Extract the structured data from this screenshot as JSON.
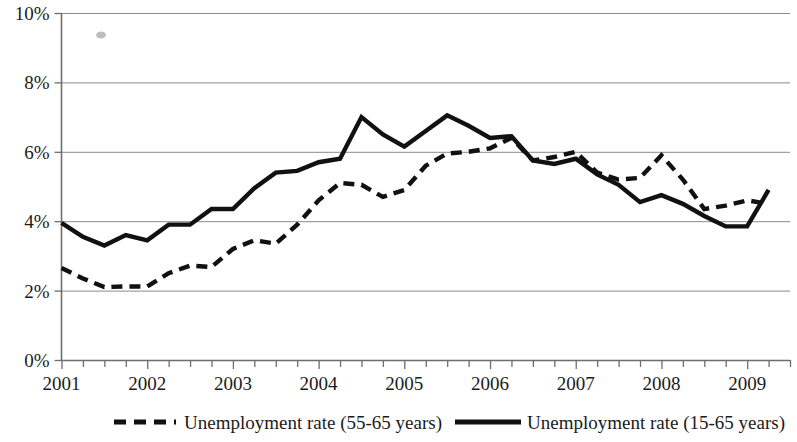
{
  "chart_data": {
    "type": "line",
    "title": "",
    "subtitle": "",
    "xlabel": "",
    "ylabel": "",
    "grid": true,
    "legend_position": "bottom",
    "ylim": [
      0,
      10
    ],
    "y_ticks": [
      "0%",
      "2%",
      "4%",
      "6%",
      "8%",
      "10%"
    ],
    "y_tick_values": [
      0,
      2,
      4,
      6,
      8,
      10
    ],
    "x_ticks": [
      "2001",
      "2002",
      "2003",
      "2004",
      "2005",
      "2006",
      "2007",
      "2008",
      "2009"
    ],
    "x_tick_values": [
      2001,
      2002,
      2003,
      2004,
      2005,
      2006,
      2007,
      2008,
      2009
    ],
    "x_minor_interval_label": "quarterly",
    "xlim": [
      2001,
      2009.5
    ],
    "x": [
      2001.0,
      2001.25,
      2001.5,
      2001.75,
      2002.0,
      2002.25,
      2002.5,
      2002.75,
      2003.0,
      2003.25,
      2003.5,
      2003.75,
      2004.0,
      2004.25,
      2004.5,
      2004.75,
      2005.0,
      2005.25,
      2005.5,
      2005.75,
      2006.0,
      2006.25,
      2006.5,
      2006.75,
      2007.0,
      2007.25,
      2007.5,
      2007.75,
      2008.0,
      2008.25,
      2008.5,
      2008.75,
      2009.0,
      2009.25
    ],
    "series": [
      {
        "name": "Unemployment rate (55-65 years)",
        "style": "dashed",
        "color": "#111111",
        "values": [
          2.65,
          2.35,
          2.1,
          2.12,
          2.12,
          2.5,
          2.72,
          2.68,
          3.2,
          3.45,
          3.35,
          3.9,
          4.6,
          5.1,
          5.05,
          4.7,
          4.9,
          5.6,
          5.95,
          6.0,
          6.1,
          6.4,
          5.75,
          5.85,
          6.0,
          5.4,
          5.2,
          5.25,
          5.9,
          5.2,
          4.35,
          4.45,
          4.6,
          4.5
        ]
      },
      {
        "name": "Unemployment rate (15-65 years)",
        "style": "solid",
        "color": "#111111",
        "values": [
          3.95,
          3.55,
          3.3,
          3.6,
          3.45,
          3.9,
          3.9,
          4.35,
          4.35,
          4.95,
          5.4,
          5.45,
          5.7,
          5.8,
          7.0,
          6.5,
          6.15,
          6.6,
          7.05,
          6.75,
          6.4,
          6.45,
          5.75,
          5.65,
          5.8,
          5.35,
          5.05,
          4.55,
          4.75,
          4.5,
          4.15,
          3.85,
          3.85,
          4.9
        ]
      }
    ],
    "legend": [
      {
        "label": "Unemployment rate (55-65 years)",
        "style": "dashed"
      },
      {
        "label": "Unemployment rate (15-65 years)",
        "style": "solid"
      }
    ]
  }
}
